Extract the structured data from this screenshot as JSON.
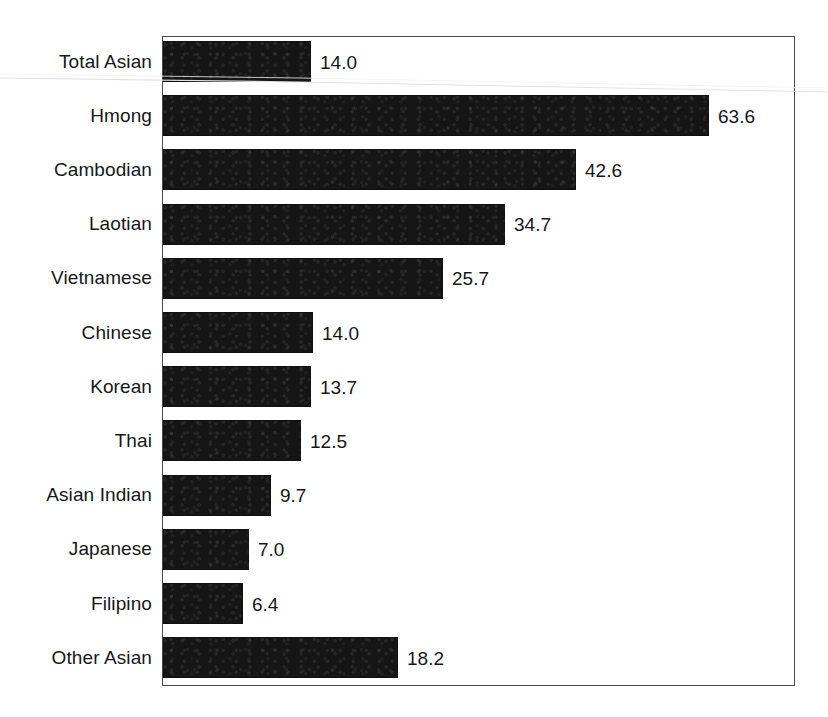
{
  "chart_data": {
    "type": "bar",
    "orientation": "horizontal",
    "title": "",
    "subtitle": "",
    "xlabel": "",
    "ylabel": "",
    "grid": false,
    "legend": false,
    "legend_position": "none",
    "axis_box": true,
    "bar_color": "#151515",
    "text_color": "#15171a",
    "border_color": "#4a4a4a",
    "background_color": "#ffffff",
    "value_label_format": "one-decimal",
    "xlim": [
      0,
      70
    ],
    "categories": [
      "Total Asian",
      "Hmong",
      "Cambodian",
      "Laotian",
      "Vietnamese",
      "Chinese",
      "Korean",
      "Thai",
      "Asian Indian",
      "Japanese",
      "Filipino",
      "Other Asian"
    ],
    "values": [
      14.0,
      63.6,
      42.6,
      34.7,
      25.7,
      14.0,
      13.7,
      12.5,
      9.7,
      7.0,
      6.4,
      18.2
    ],
    "value_labels": [
      "14.0",
      "63.6",
      "42.6",
      "34.7",
      "25.7",
      "14.0",
      "13.7",
      "12.5",
      "9.7",
      "7.0",
      "6.4",
      "18.2"
    ],
    "bar_pixel_widths": [
      148,
      546,
      413,
      342,
      280,
      150,
      148,
      138,
      108,
      86,
      80,
      235
    ],
    "tick_labels_x": [],
    "tick_labels_y": [
      "Total Asian",
      "Hmong",
      "Cambodian",
      "Laotian",
      "Vietnamese",
      "Chinese",
      "Korean",
      "Thai",
      "Asian Indian",
      "Japanese",
      "Filipino",
      "Other Asian"
    ]
  },
  "rows": [
    {
      "label": "Total Asian",
      "value_label": "14.0",
      "width_px": 148
    },
    {
      "label": "Hmong",
      "value_label": "63.6",
      "width_px": 546
    },
    {
      "label": "Cambodian",
      "value_label": "42.6",
      "width_px": 413
    },
    {
      "label": "Laotian",
      "value_label": "34.7",
      "width_px": 342
    },
    {
      "label": "Vietnamese",
      "value_label": "25.7",
      "width_px": 280
    },
    {
      "label": "Chinese",
      "value_label": "14.0",
      "width_px": 150
    },
    {
      "label": "Korean",
      "value_label": "13.7",
      "width_px": 148
    },
    {
      "label": "Thai",
      "value_label": "12.5",
      "width_px": 138
    },
    {
      "label": "Asian Indian",
      "value_label": "9.7",
      "width_px": 108
    },
    {
      "label": "Japanese",
      "value_label": "7.0",
      "width_px": 86
    },
    {
      "label": "Filipino",
      "value_label": "6.4",
      "width_px": 80
    },
    {
      "label": "Other Asian",
      "value_label": "18.2",
      "width_px": 235
    }
  ],
  "layout": {
    "row_pitch_px": 54.2,
    "bar_height_px": 41,
    "first_row_top_px": 4
  }
}
